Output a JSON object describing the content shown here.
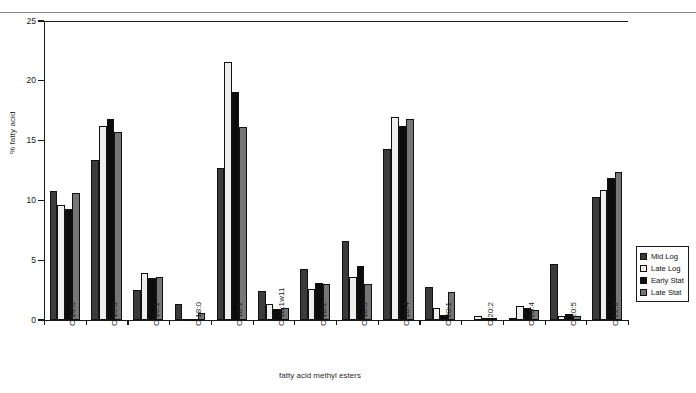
{
  "chart_data": {
    "type": "bar",
    "title": "",
    "xlabel": "fatty acid methyl esters",
    "ylabel": "% fatty acid",
    "ylim": [
      0,
      25
    ],
    "yticks": [
      0,
      5,
      10,
      15,
      20,
      25
    ],
    "grid": false,
    "legend_position": "right",
    "categories": [
      "C 14:0",
      "C 16:0",
      "C 16:1",
      "C 18:0",
      "C 18:1",
      "C 18:1w11",
      "C 18:2",
      "C 18:3",
      "C 18:4",
      "C 20:1",
      "C 20:2",
      "C 20:4",
      "C 20:5",
      "C 22:6"
    ],
    "series": [
      {
        "name": "Mid Log",
        "color": "#3b3b3b",
        "values": [
          10.8,
          13.4,
          2.5,
          1.3,
          12.7,
          2.4,
          4.3,
          6.6,
          14.3,
          2.8,
          0.0,
          0.2,
          4.7,
          10.3
        ]
      },
      {
        "name": "Late Log",
        "color": "#eeeeec",
        "values": [
          9.6,
          16.2,
          3.9,
          0.1,
          21.6,
          1.3,
          2.6,
          3.6,
          17.0,
          1.0,
          0.3,
          1.2,
          0.3,
          10.9
        ]
      },
      {
        "name": "Early Stat",
        "color": "#0c0c0c",
        "values": [
          9.3,
          16.8,
          3.5,
          0.1,
          19.1,
          0.9,
          3.1,
          4.5,
          16.2,
          0.4,
          0.2,
          1.0,
          0.5,
          11.9
        ]
      },
      {
        "name": "Late Stat",
        "color": "#767676",
        "values": [
          10.6,
          15.7,
          3.6,
          0.6,
          16.1,
          1.0,
          3.0,
          3.0,
          16.8,
          2.3,
          0.2,
          0.8,
          0.3,
          12.4
        ]
      }
    ]
  },
  "legend": {
    "items": [
      {
        "label": "Mid Log"
      },
      {
        "label": "Late Log"
      },
      {
        "label": "Early Stat"
      },
      {
        "label": "Late Stat"
      }
    ]
  }
}
